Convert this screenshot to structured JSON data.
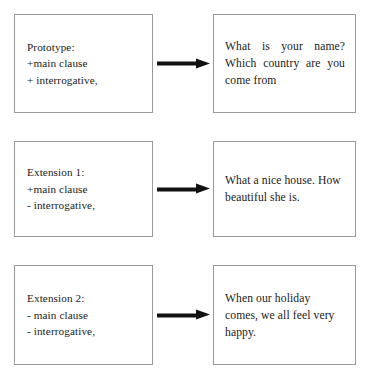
{
  "diagram": {
    "type": "flow-diagram",
    "title": "",
    "rows": [
      {
        "id": "prototype",
        "left_box": {
          "label": "Prototype:\n+main clause\n+ interrogative,",
          "lines": [
            "Prototype:",
            "+main clause",
            "+ interrogative,"
          ]
        },
        "arrow": {
          "icon": "right-arrow-icon",
          "direction": "right"
        },
        "right_box": {
          "label": "What is your name? Which country are you come from",
          "justify": true,
          "lines": [
            "What is your name?",
            "Which country are",
            "you come from"
          ]
        }
      },
      {
        "id": "extension-1",
        "left_box": {
          "label": "Extension 1:\n+main clause\n- interrogative,",
          "lines": [
            "Extension 1:",
            "+main clause",
            "- interrogative,"
          ]
        },
        "arrow": {
          "icon": "right-arrow-icon",
          "direction": "right"
        },
        "right_box": {
          "label": "What a nice house.\nHow beautiful she is.",
          "justify": false,
          "lines": [
            "What a nice house.",
            "How beautiful she is."
          ]
        }
      },
      {
        "id": "extension-2",
        "left_box": {
          "label": "Extension 2:\n- main clause\n- interrogative,",
          "lines": [
            "Extension 2:",
            "- main clause",
            "- interrogative,"
          ]
        },
        "arrow": {
          "icon": "right-arrow-icon",
          "direction": "right"
        },
        "right_box": {
          "label": "When our holiday comes, we all feel very happy.",
          "justify": false,
          "lines": [
            "When our holiday",
            "comes, we all feel very",
            "happy."
          ]
        }
      }
    ],
    "colors": {
      "box_border": "#9a9a9a",
      "arrow": "#111111",
      "text": "#1a1a1a",
      "background": "#ffffff"
    }
  }
}
